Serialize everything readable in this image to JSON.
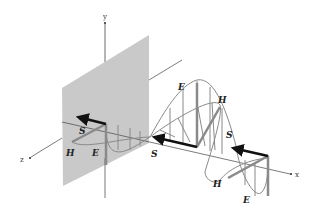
{
  "figure": {
    "axes": {
      "x": "x",
      "y": "y",
      "z": "z"
    },
    "vectors": {
      "S_left": "S",
      "H_left": "H",
      "E_left": "E",
      "E_mid": "E",
      "H_mid": "H",
      "S_mid_left": "S",
      "S_mid_right": "S",
      "H_right": "H",
      "E_right": "E"
    },
    "colors": {
      "plate": "#c8c8c8",
      "field_curve": "#8a8a8a",
      "s_arrow": "#111111",
      "axis": "#444444"
    }
  }
}
